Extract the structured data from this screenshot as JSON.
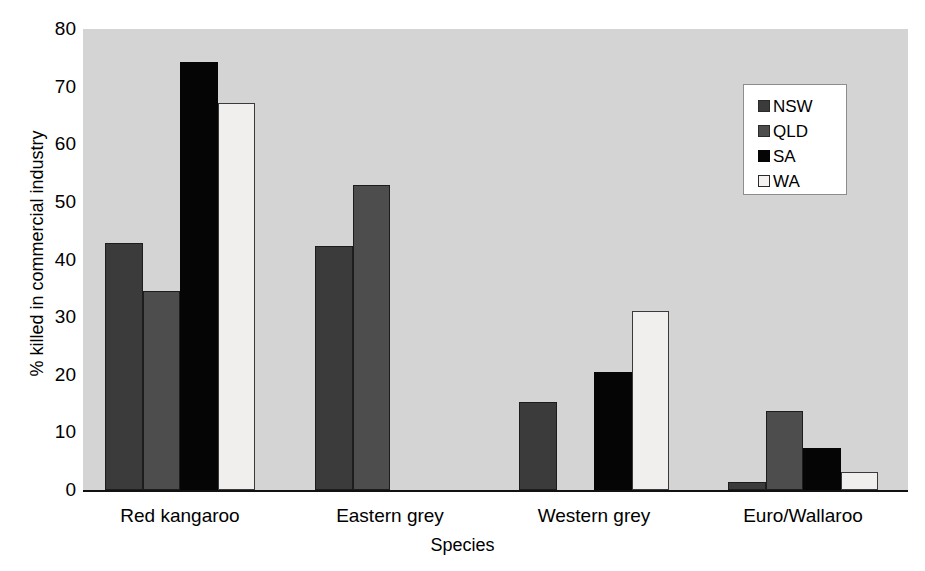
{
  "chart_data": {
    "type": "bar",
    "title": "",
    "xlabel": "Species",
    "ylabel": "% killed in commercial  industry",
    "categories": [
      "Red kangaroo",
      "Eastern grey",
      "Western grey",
      "Euro/Wallaroo"
    ],
    "series": [
      {
        "name": "NSW",
        "color": "#3b3b3b",
        "values": [
          42.8,
          42.3,
          15.2,
          1.4
        ]
      },
      {
        "name": "QLD",
        "color": "#4d4d4d",
        "values": [
          34.6,
          53.0,
          null,
          13.7
        ]
      },
      {
        "name": "SA",
        "color": "#050505",
        "values": [
          74.2,
          null,
          20.4,
          7.3
        ]
      },
      {
        "name": "WA",
        "color": "#f0efee",
        "values": [
          67.2,
          null,
          31.0,
          3.1
        ]
      }
    ],
    "ylim": [
      0,
      80
    ],
    "yticks": [
      "0",
      "10",
      "20",
      "30",
      "40",
      "50",
      "60",
      "70",
      "80"
    ],
    "grid": false,
    "legend_position": "top-right",
    "plot_background": "#d4d4d4"
  },
  "legend": {
    "entries": [
      {
        "label": "NSW"
      },
      {
        "label": "QLD"
      },
      {
        "label": "SA"
      },
      {
        "label": "WA"
      }
    ]
  }
}
